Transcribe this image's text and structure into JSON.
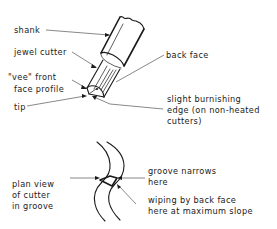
{
  "diagram": {
    "top_view": {
      "labels": {
        "shank": "shank",
        "jewel_cutter": "jewel cutter",
        "vee_front_face_line1": "\"vee\" front",
        "vee_front_face_line2": "face profile",
        "tip": "tip",
        "back_face": "back face",
        "burnishing_line1": "slight burnishing",
        "burnishing_line2": "edge (on non-heated",
        "burnishing_line3": "cutters)"
      }
    },
    "plan_view": {
      "labels": {
        "plan_line1": "plan view",
        "plan_line2": "of cutter",
        "plan_line3": "in groove",
        "groove_line1": "groove narrows",
        "groove_line2": "here",
        "wiping_line1": "wiping by back face",
        "wiping_line2": "here at maximum slope"
      }
    },
    "colors": {
      "ink": "#1a1a1a",
      "leader": "#555555",
      "background": "#ffffff"
    }
  }
}
